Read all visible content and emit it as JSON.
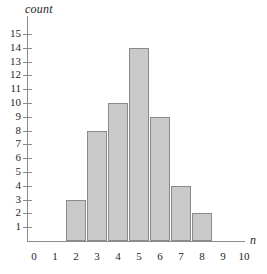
{
  "chart_data": {
    "type": "bar",
    "title": "",
    "xlabel": "n",
    "ylabel": "count",
    "categories": [
      0,
      1,
      2,
      3,
      4,
      5,
      6,
      7,
      8,
      9,
      10
    ],
    "values": [
      0,
      0,
      3,
      8,
      10,
      14,
      9,
      4,
      2,
      0,
      0
    ],
    "xtick_labels": [
      "0",
      "1",
      "2",
      "3",
      "4",
      "5",
      "6",
      "7",
      "8",
      "9",
      "10"
    ],
    "ytick_labels": [
      "1",
      "2",
      "3",
      "4",
      "5",
      "6",
      "7",
      "8",
      "9",
      "10",
      "11",
      "12",
      "13",
      "14",
      "15"
    ],
    "ytick_values": [
      1,
      2,
      3,
      4,
      5,
      6,
      7,
      8,
      9,
      10,
      11,
      12,
      13,
      14,
      15
    ],
    "xlim": [
      -0.55,
      10.6
    ],
    "ylim": [
      0,
      15.6
    ],
    "grid": false,
    "legend": null,
    "bars": [
      {
        "n": "2",
        "count": 3
      },
      {
        "n": "3",
        "count": 8
      },
      {
        "n": "4",
        "count": 10
      },
      {
        "n": "5",
        "count": 14
      },
      {
        "n": "6",
        "count": 9
      },
      {
        "n": "7",
        "count": 4
      },
      {
        "n": "8",
        "count": 2
      }
    ],
    "colors": {
      "bar_fill": "#c9c9c9",
      "bar_stroke": "#8a8a8a",
      "axis": "#8c8c8c",
      "text": "#1f1f1f",
      "background": "#ffffff"
    }
  }
}
